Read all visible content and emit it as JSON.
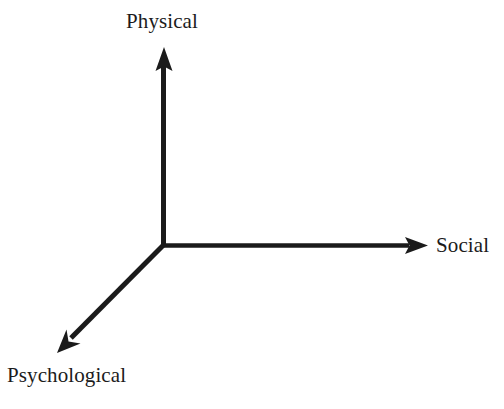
{
  "figure": {
    "kind": "three-axis-conceptual-diagram",
    "background_color": "#ffffff",
    "stroke_color": "#1b1b1b",
    "text_color": "#1b1b1b"
  },
  "axes": {
    "origin": {
      "x": 163,
      "y": 245
    },
    "items": [
      {
        "id": "physical",
        "label": "Physical",
        "direction": "up",
        "tip": {
          "x": 164,
          "y": 47
        },
        "shaft_width": 5
      },
      {
        "id": "social",
        "label": "Social",
        "direction": "right",
        "tip": {
          "x": 428,
          "y": 245
        },
        "shaft_width": 4
      },
      {
        "id": "psychological",
        "label": "Psychological",
        "direction": "down-left",
        "tip": {
          "x": 57,
          "y": 353
        },
        "shaft_width": 5
      }
    ]
  },
  "labels": {
    "physical": "Physical",
    "social": "Social",
    "psychological": "Psychological"
  }
}
